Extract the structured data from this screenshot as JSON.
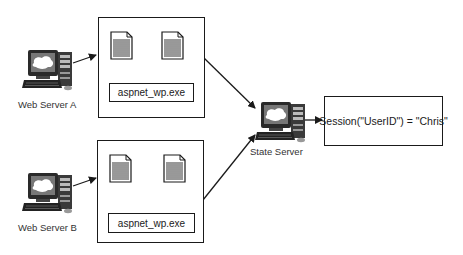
{
  "diagram": {
    "nodes": {
      "web_server_a": {
        "label": "Web Server A"
      },
      "web_server_b": {
        "label": "Web Server B"
      },
      "state_server": {
        "label": "State Server"
      },
      "process_box_a": {
        "process_label": "aspnet_wp.exe",
        "documents": 2
      },
      "process_box_b": {
        "process_label": "aspnet_wp.exe",
        "documents": 2
      },
      "session_store": {
        "label": "Session(\"UserID\") = \"Chris\""
      }
    },
    "edges": [
      {
        "from": "web_server_a",
        "to": "process_box_a"
      },
      {
        "from": "web_server_b",
        "to": "process_box_b"
      },
      {
        "from": "process_box_a",
        "to": "state_server"
      },
      {
        "from": "process_box_b",
        "to": "state_server"
      },
      {
        "from": "state_server",
        "to": "session_store"
      }
    ]
  }
}
